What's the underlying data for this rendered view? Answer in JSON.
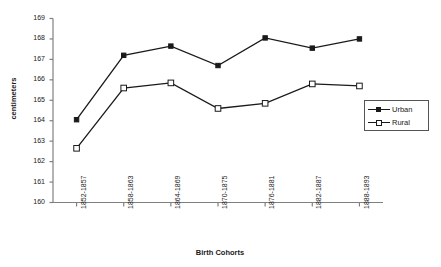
{
  "chart_data": {
    "type": "line",
    "title": "",
    "xlabel": "Birth Cohorts",
    "ylabel": "centimeters",
    "categories": [
      "1852-1857",
      "1858-1863",
      "1864-1869",
      "1870-1875",
      "1876-1881",
      "1882-1887",
      "1888-1893"
    ],
    "ylim": [
      160,
      169
    ],
    "yticks": [
      160,
      161,
      162,
      163,
      164,
      165,
      166,
      167,
      168,
      169
    ],
    "grid": false,
    "legend_position": "right",
    "series": [
      {
        "name": "Urban",
        "marker": "filled-square",
        "color": "#1a1a1a",
        "values": [
          164.05,
          167.2,
          167.65,
          166.7,
          168.05,
          167.55,
          168.0
        ]
      },
      {
        "name": "Rural",
        "marker": "open-square",
        "color": "#1a1a1a",
        "values": [
          162.65,
          165.6,
          165.85,
          164.6,
          164.85,
          165.8,
          165.7
        ]
      }
    ]
  },
  "legend": {
    "items": [
      {
        "label": "Urban"
      },
      {
        "label": "Rural"
      }
    ]
  }
}
